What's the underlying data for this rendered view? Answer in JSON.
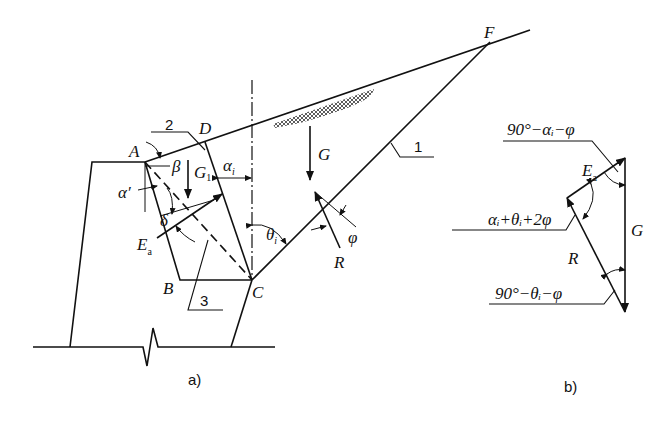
{
  "figure": {
    "panel_a": {
      "caption": "a)",
      "points": {
        "A": "A",
        "B": "B",
        "C": "C",
        "D": "D",
        "F": "F"
      },
      "callouts": {
        "one": "1",
        "two": "2",
        "three": "3"
      },
      "forces": {
        "G": "G",
        "G1": "G",
        "G1_sub": "1",
        "Ea": "E",
        "Ea_sub": "a",
        "R": "R"
      },
      "angles": {
        "alpha_i": "α",
        "alpha_i_sub": "i",
        "beta": "β",
        "alpha_prime": "α′",
        "delta": "δ",
        "theta_i": "θ",
        "theta_i_sub": "i",
        "phi": "φ"
      }
    },
    "panel_b": {
      "caption": "b)",
      "forces": {
        "Ea": "E",
        "Ea_sub": "a",
        "G": "G",
        "R": "R"
      },
      "angle_labels": {
        "top": "90°−αᵢ−φ",
        "middle": "αᵢ+θᵢ+2φ",
        "bottom": "90°−θᵢ−φ"
      }
    }
  }
}
